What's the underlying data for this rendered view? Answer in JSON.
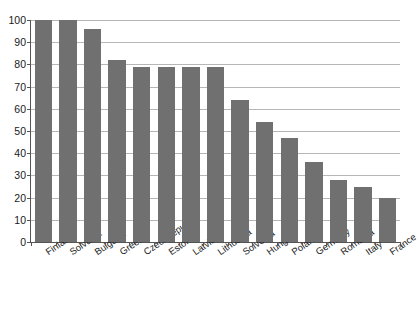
{
  "chart_data": {
    "type": "bar",
    "title": "",
    "subtitle": "",
    "xlabel": "",
    "ylabel": "",
    "ylim": [
      0,
      100
    ],
    "ytick_step": 10,
    "yticks": [
      0,
      10,
      20,
      30,
      40,
      50,
      60,
      70,
      80,
      90,
      100
    ],
    "grid": "horizontal",
    "legend": "none",
    "bar_color": "#707070",
    "gridline_color": "#b6b6b6",
    "axis_color": "#555555",
    "categories": [
      "Finland",
      "Solvakia",
      "Bulgaria",
      "Greece",
      "Czech republic",
      "Estonia",
      "Latvia",
      "Lithuania",
      "Solvenia",
      "Hungary",
      "Poland",
      "Germany",
      "Romania",
      "Italy",
      "France"
    ],
    "values": [
      100,
      100,
      96,
      82,
      79,
      79,
      79,
      79,
      64,
      54,
      47,
      36,
      28,
      25,
      20
    ]
  }
}
